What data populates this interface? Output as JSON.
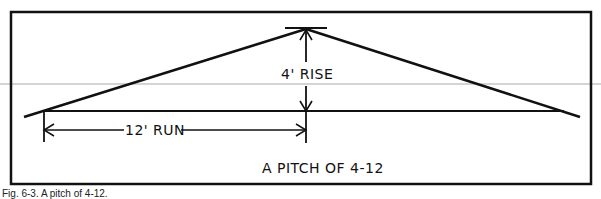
{
  "figure": {
    "caption": "Fig. 6-3. A pitch of 4-12.",
    "labels": {
      "rise": "4' RISE",
      "run": "12' RUN",
      "pitch": "A PITCH OF 4-12"
    },
    "values": {
      "rise_ft": 4,
      "run_ft": 12,
      "pitch": "4-12"
    },
    "colors": {
      "line": "#111111",
      "background": "#ffffff",
      "scan_line": "#d0d0d0"
    }
  }
}
